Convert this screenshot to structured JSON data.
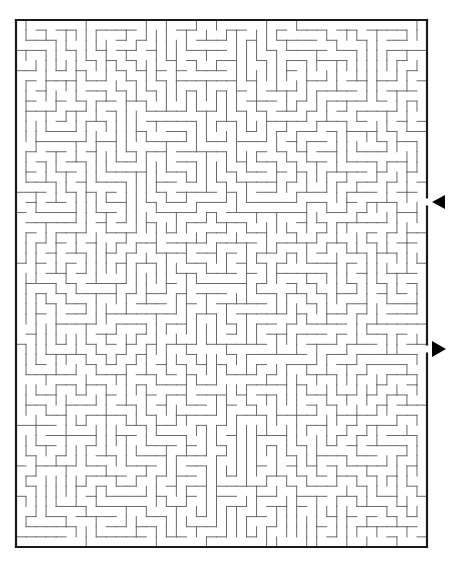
{
  "puzzle": {
    "type": "maze",
    "border": {
      "left": 16,
      "top": 20,
      "right": 427,
      "bottom": 547,
      "stroke": "#1a1a1a",
      "width": 2.2
    },
    "grid": {
      "cols": 41,
      "rows": 52,
      "cell": 10.1,
      "wall_color": "#6a6a6a",
      "wall_width": 1
    },
    "entry": {
      "side": "right",
      "y": 202,
      "arrow_direction": "left",
      "label": "entry-arrow"
    },
    "exit": {
      "side": "right",
      "y": 349,
      "arrow_direction": "right",
      "label": "exit-arrow"
    },
    "arrow_color": "#000000",
    "seed": 7331
  }
}
